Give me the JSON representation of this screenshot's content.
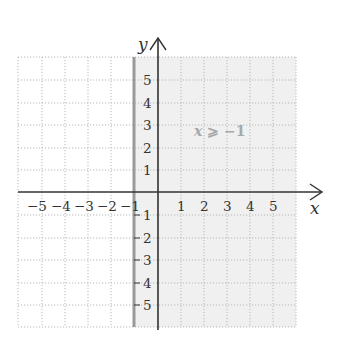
{
  "graph": {
    "x_axis_label": "x",
    "y_axis_label": "y",
    "x_ticks_negative": [
      "−5",
      "−4",
      "−3",
      "−2",
      "−1"
    ],
    "x_ticks_positive": [
      "1",
      "2",
      "3",
      "4",
      "5"
    ],
    "y_ticks_positive": [
      "5",
      "4",
      "3",
      "2",
      "1"
    ],
    "y_ticks_negative": [
      "1",
      "2",
      "3",
      "4",
      "5"
    ],
    "inequality_label": "x ⩾ −1",
    "inequality_var": "x",
    "inequality_rest": " ⩾ −1",
    "x_range": [
      -5.5,
      5.5
    ],
    "y_range": [
      -5.5,
      5.5
    ],
    "boundary": {
      "x": -1,
      "style": "solid",
      "color": "#9a9a9a"
    },
    "shaded_region": {
      "condition": "x >= -1",
      "color": "#f0f0f0"
    },
    "grid_color": "#b8b8b8",
    "axis_color": "#333333"
  }
}
